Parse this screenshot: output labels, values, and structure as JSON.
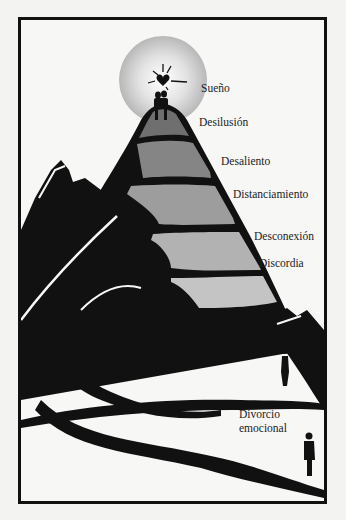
{
  "diagram": {
    "type": "mountain-stages",
    "stages": [
      {
        "label": "Sueño",
        "fill": "#b9b9b9"
      },
      {
        "label": "Desilusión",
        "fill": "#6f6f6f"
      },
      {
        "label": "Desaliento",
        "fill": "#858585"
      },
      {
        "label": "Distanciamiento",
        "fill": "#9d9d9d"
      },
      {
        "label": "Desconexión",
        "fill": "#b2b2b2"
      },
      {
        "label": "Discordia",
        "fill": "#c4c4c4"
      }
    ],
    "bottom_label_line1": "Divorcio",
    "bottom_label_line2": "emocional",
    "icons": [
      "heart-icon",
      "couple-figure",
      "woman-figure",
      "man-figure",
      "sun-halo"
    ],
    "colors": {
      "ink": "#111111",
      "paper": "#f7f7f5"
    }
  }
}
